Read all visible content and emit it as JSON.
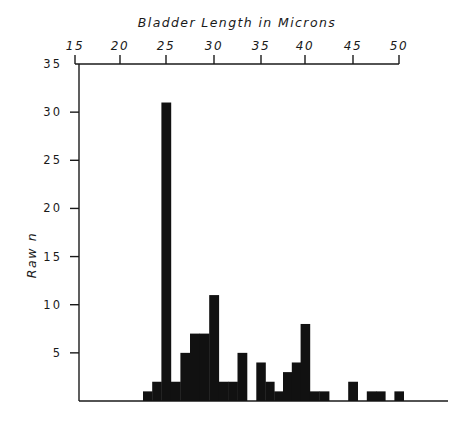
{
  "chart_data": {
    "type": "bar",
    "title": "Bladder Length in Microns",
    "xlabel": "Bladder Length in Microns",
    "ylabel": "Raw n",
    "x_axis_position": "top",
    "xlim": [
      15,
      50
    ],
    "ylim": [
      0,
      35
    ],
    "x_ticks": [
      15,
      20,
      25,
      30,
      35,
      40,
      45,
      50
    ],
    "y_ticks": [
      5,
      10,
      15,
      20,
      25,
      30,
      35
    ],
    "grid": false,
    "legend": null,
    "bar_color": "#111111",
    "categories": [
      23,
      24,
      25,
      26,
      27,
      28,
      29,
      30,
      31,
      32,
      33,
      34,
      35,
      36,
      37,
      38,
      39,
      40,
      41,
      42,
      43,
      44,
      45,
      46,
      47,
      48,
      49,
      50
    ],
    "values": [
      1,
      2,
      31,
      2,
      5,
      7,
      7,
      11,
      2,
      2,
      5,
      0,
      4,
      2,
      1,
      3,
      4,
      8,
      1,
      1,
      0,
      0,
      2,
      0,
      1,
      1,
      0,
      1
    ]
  }
}
